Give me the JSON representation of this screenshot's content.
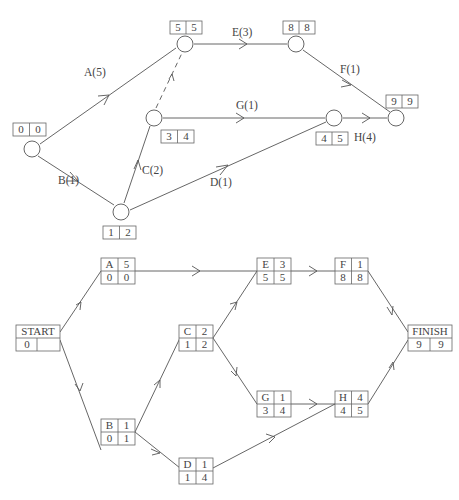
{
  "top_diagram": {
    "type": "activity-on-arrow network",
    "nodes": [
      {
        "id": "n1",
        "early": "0",
        "late": "0"
      },
      {
        "id": "n2",
        "early": "5",
        "late": "5"
      },
      {
        "id": "n3",
        "early": "3",
        "late": "4"
      },
      {
        "id": "n4",
        "early": "1",
        "late": "2"
      },
      {
        "id": "n5",
        "early": "8",
        "late": "8"
      },
      {
        "id": "n6",
        "early": "4",
        "late": "5"
      },
      {
        "id": "n7",
        "early": "9",
        "late": "9"
      }
    ],
    "activities": [
      {
        "label": "A(5)",
        "from": "n1",
        "to": "n2"
      },
      {
        "label": "B(1)",
        "from": "n1",
        "to": "n4"
      },
      {
        "label": "C(2)",
        "from": "n4",
        "to": "n3"
      },
      {
        "label": "D(1)",
        "from": "n4",
        "to": "n6"
      },
      {
        "label": "E(3)",
        "from": "n2",
        "to": "n5"
      },
      {
        "label": "F(1)",
        "from": "n5",
        "to": "n7"
      },
      {
        "label": "G(1)",
        "from": "n3",
        "to": "n6"
      },
      {
        "label": "H(4)",
        "from": "n6",
        "to": "n7"
      },
      {
        "label": "",
        "from": "n3",
        "to": "n2",
        "dummy": true
      }
    ]
  },
  "bottom_diagram": {
    "type": "activity-on-node network",
    "nodes": [
      {
        "name": "START",
        "top": "START",
        "bl": "0",
        "br": ""
      },
      {
        "name": "A",
        "top_left": "A",
        "top_right": "5",
        "bl": "0",
        "br": "0"
      },
      {
        "name": "B",
        "top_left": "B",
        "top_right": "1",
        "bl": "0",
        "br": "1"
      },
      {
        "name": "C",
        "top_left": "C",
        "top_right": "2",
        "bl": "1",
        "br": "2"
      },
      {
        "name": "D",
        "top_left": "D",
        "top_right": "1",
        "bl": "1",
        "br": "4"
      },
      {
        "name": "E",
        "top_left": "E",
        "top_right": "3",
        "bl": "5",
        "br": "5"
      },
      {
        "name": "F",
        "top_left": "F",
        "top_right": "1",
        "bl": "8",
        "br": "8"
      },
      {
        "name": "G",
        "top_left": "G",
        "top_right": "1",
        "bl": "3",
        "br": "4"
      },
      {
        "name": "H",
        "top_left": "H",
        "top_right": "4",
        "bl": "4",
        "br": "5"
      },
      {
        "name": "FINISH",
        "top": "FINISH",
        "bl": "9",
        "br": "9"
      }
    ],
    "edges": [
      [
        "START",
        "A"
      ],
      [
        "START",
        "B"
      ],
      [
        "A",
        "E"
      ],
      [
        "B",
        "C"
      ],
      [
        "B",
        "D"
      ],
      [
        "C",
        "E"
      ],
      [
        "C",
        "G"
      ],
      [
        "D",
        "H"
      ],
      [
        "E",
        "F"
      ],
      [
        "G",
        "H"
      ],
      [
        "F",
        "FINISH"
      ],
      [
        "H",
        "FINISH"
      ]
    ]
  }
}
